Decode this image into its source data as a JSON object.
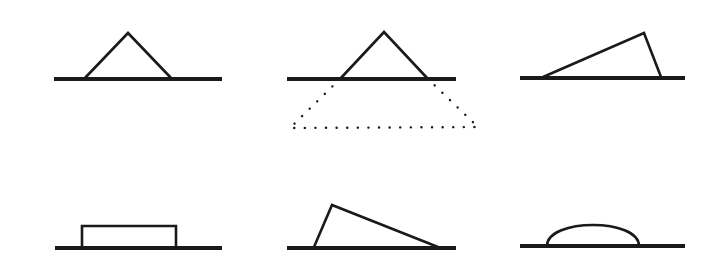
{
  "figure": {
    "width": 720,
    "height": 269,
    "background": "#ffffff",
    "stroke_color": "#1a1a1a",
    "panels": [
      {
        "id": "top-left",
        "description": "isosceles triangle resting on ground line",
        "baseline": {
          "x1": 54,
          "x2": 222,
          "y": 79
        },
        "shape": {
          "type": "polyline",
          "points": "84,79 128,33 172,79"
        }
      },
      {
        "id": "top-middle",
        "description": "isosceles triangle on ground line with dotted inverted trapezoid below",
        "baseline": {
          "x1": 287,
          "x2": 456,
          "y": 79
        },
        "shape": {
          "type": "polyline",
          "points": "340,79 384,32 428,79"
        },
        "dotted": {
          "type": "polyline",
          "points": "340,79 290,128 478,127 428,79"
        }
      },
      {
        "id": "top-right",
        "description": "scalene triangle leaning right",
        "baseline": {
          "x1": 520,
          "x2": 685,
          "y": 78
        },
        "shape": {
          "type": "polyline",
          "points": "543,77 644,33 661,77"
        }
      },
      {
        "id": "bottom-left",
        "description": "flat rectangle on ground line",
        "baseline": {
          "x1": 55,
          "x2": 222,
          "y": 248
        },
        "shape": {
          "type": "polyline",
          "points": "82,248 82,226 176,226 176,248"
        }
      },
      {
        "id": "bottom-middle",
        "description": "scalene triangle leaning left",
        "baseline": {
          "x1": 287,
          "x2": 456,
          "y": 248
        },
        "shape": {
          "type": "polyline",
          "points": "314,247 332,205 438,247"
        }
      },
      {
        "id": "bottom-right",
        "description": "low dome / arc on ground line",
        "baseline": {
          "x1": 520,
          "x2": 685,
          "y": 246
        },
        "shape": {
          "type": "path",
          "d": "M547,246 C547,218 639,218 639,246"
        }
      }
    ]
  }
}
